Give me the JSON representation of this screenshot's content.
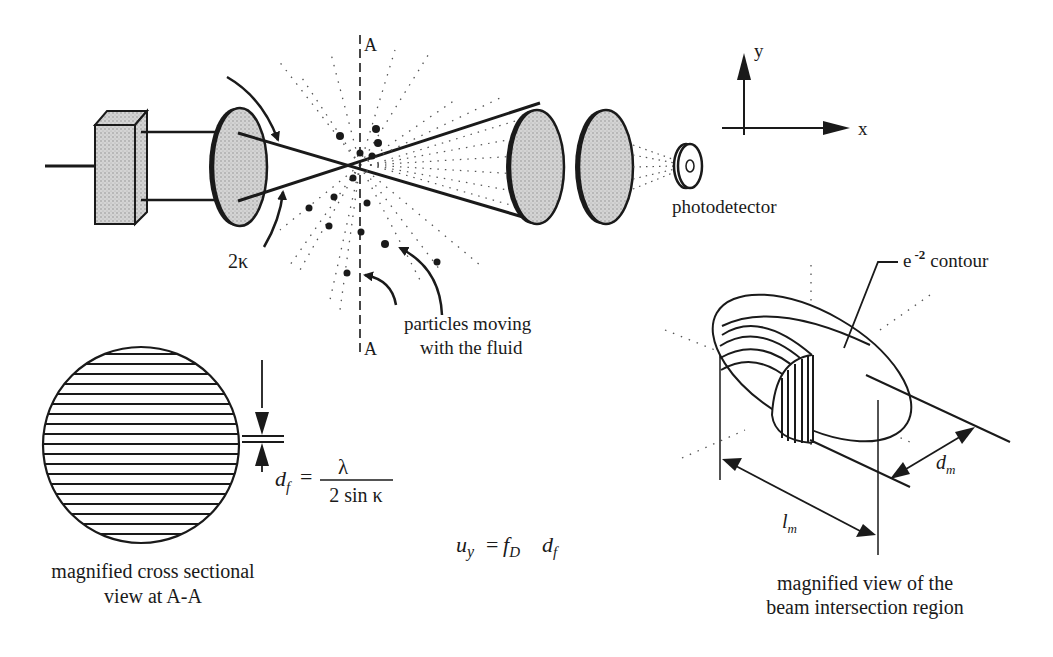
{
  "diagram": {
    "colors": {
      "ink": "#1a1a1a",
      "lens_fill": "#c8c8c8",
      "background": "#ffffff"
    },
    "labels": {
      "section_top": "A",
      "section_bottom": "A",
      "angle": "2κ",
      "photodetector": "photodetector",
      "particles_line1": "particles moving",
      "particles_line2": "with the fluid",
      "axis_y": "y",
      "axis_x": "x",
      "contour_base": "e",
      "contour_exp": "-2",
      "contour_word": "contour"
    },
    "formulas": {
      "fringe_lhs": "d",
      "fringe_lhs_sub": "f",
      "fringe_eq": "=",
      "fringe_num": "λ",
      "fringe_den": "2 sin κ",
      "velocity_u": "u",
      "velocity_u_sub": "y",
      "velocity_eq": "=",
      "velocity_f": "f",
      "velocity_f_sub": "D",
      "velocity_d": "d",
      "velocity_d_sub": "f"
    },
    "dimensions": {
      "probe_width": "d",
      "probe_width_sub": "m",
      "probe_length": "l",
      "probe_length_sub": "m"
    },
    "captions": {
      "cross_section_line1": "magnified cross sectional",
      "cross_section_line2": "view at A-A",
      "intersection_line1": "magnified view of the",
      "intersection_line2": "beam intersection region"
    }
  }
}
